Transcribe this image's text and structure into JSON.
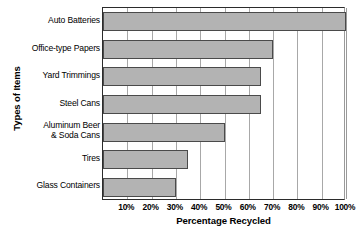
{
  "chart_data": {
    "type": "bar",
    "orientation": "horizontal",
    "title": "",
    "xlabel": "Percentage Recycled",
    "ylabel": "Types of Items",
    "categories": [
      "Auto Batteries",
      "Office-type Papers",
      "Yard Trimmings",
      "Steel Cans",
      "Aluminum Beer\n& Soda Cans",
      "Tires",
      "Glass Containers"
    ],
    "values": [
      100,
      70,
      65,
      65,
      50,
      35,
      30
    ],
    "xlim": [
      0,
      100
    ],
    "xtick_values": [
      10,
      20,
      30,
      40,
      50,
      60,
      70,
      80,
      90,
      100
    ],
    "xtick_labels": [
      "10%",
      "20%",
      "30%",
      "40%",
      "50%",
      "60%",
      "70%",
      "80%",
      "90%",
      "100%"
    ],
    "grid": true,
    "legend": false,
    "bar_color": "#b3b3b3",
    "bar_border_color": "#4a4a4a",
    "gridline_color": "#a8a8a8",
    "axis_color": "#2b2b2b"
  },
  "axes": {
    "y_title": "Types of Items",
    "x_title": "Percentage Recycled"
  },
  "categories": [
    {
      "line1": "Auto Batteries",
      "line2": ""
    },
    {
      "line1": "Office-type Papers",
      "line2": ""
    },
    {
      "line1": "Yard Trimmings",
      "line2": ""
    },
    {
      "line1": "Steel Cans",
      "line2": ""
    },
    {
      "line1": "Aluminum Beer",
      "line2": "& Soda Cans"
    },
    {
      "line1": "Tires",
      "line2": ""
    },
    {
      "line1": "Glass Containers",
      "line2": ""
    }
  ]
}
